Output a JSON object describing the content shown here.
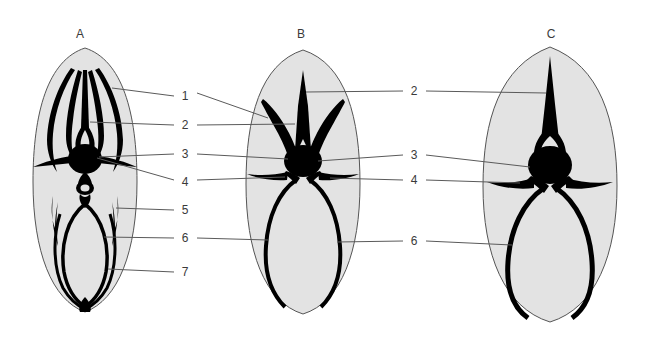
{
  "figure": {
    "background_color": "#ffffff",
    "body_fill_color": "#e3e3e3",
    "body_outline_color": "#555555",
    "sclerite_color": "#000000",
    "leader_line_color": "#5a5a5a",
    "label_text_color": "#3a3a3a"
  },
  "panels": [
    {
      "id": "panel-a",
      "letter": "A",
      "letter_x": 80,
      "letter_y": 34,
      "center_x": 85,
      "callouts": [
        "1",
        "2",
        "3",
        "4",
        "5",
        "6",
        "7"
      ]
    },
    {
      "id": "panel-b",
      "letter": "B",
      "letter_x": 301,
      "letter_y": 34,
      "center_x": 303,
      "callouts": [
        "2",
        "3",
        "4",
        "6"
      ]
    },
    {
      "id": "panel-c",
      "letter": "C",
      "letter_x": 551,
      "letter_y": 34,
      "center_x": 550,
      "callouts": [
        "2",
        "3",
        "4",
        "6"
      ]
    }
  ],
  "callouts_left": [
    {
      "label": "1",
      "x": 185,
      "y": 96,
      "target_panel": "B"
    },
    {
      "label": "2",
      "x": 185,
      "y": 125,
      "target_panel": "A"
    },
    {
      "label": "3",
      "x": 185,
      "y": 154,
      "target_panel": "A"
    },
    {
      "label": "4",
      "x": 185,
      "y": 182,
      "target_panel": "A"
    },
    {
      "label": "5",
      "x": 185,
      "y": 210,
      "target_panel": "A"
    },
    {
      "label": "6",
      "x": 185,
      "y": 238,
      "target_panel": "A"
    },
    {
      "label": "7",
      "x": 185,
      "y": 272,
      "target_panel": "A"
    }
  ],
  "callouts_right": [
    {
      "label": "2",
      "x": 414,
      "y": 91,
      "target_panel": "C"
    },
    {
      "label": "3",
      "x": 414,
      "y": 155,
      "target_panel": "C"
    },
    {
      "label": "4",
      "x": 414,
      "y": 180,
      "target_panel": "C"
    },
    {
      "label": "6",
      "x": 414,
      "y": 241,
      "target_panel": "C"
    }
  ]
}
